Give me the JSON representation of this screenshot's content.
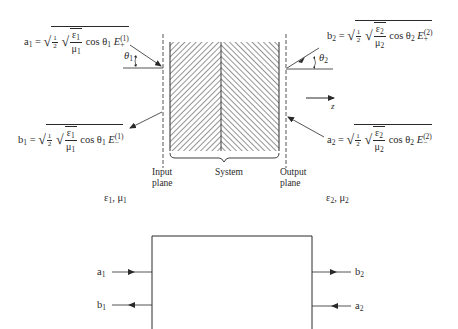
{
  "figure": {
    "top_diagram": {
      "formulas": {
        "a1": {
          "lhs": "a",
          "lhs_sub": "1",
          "num": "1",
          "den": "2",
          "eps": "ε",
          "eps_sub": "1",
          "mu": "μ",
          "mu_sub": "1",
          "cos": "cos θ",
          "cos_sub": "1",
          "field": "E",
          "field_sub": "+",
          "field_sup": "(1)"
        },
        "b1": {
          "lhs": "b",
          "lhs_sub": "1",
          "num": "1",
          "den": "2",
          "eps": "ε",
          "eps_sub": "1",
          "mu": "μ",
          "mu_sub": "1",
          "cos": "cos θ",
          "cos_sub": "1",
          "field": "E",
          "field_sub": "−",
          "field_sup": "(1)"
        },
        "b2": {
          "lhs": "b",
          "lhs_sub": "2",
          "num": "1",
          "den": "2",
          "eps": "ε",
          "eps_sub": "2",
          "mu": "μ",
          "mu_sub": "2",
          "cos": "cos θ",
          "cos_sub": "2",
          "field": "E",
          "field_sub": "+",
          "field_sup": "(2)"
        },
        "a2": {
          "lhs": "a",
          "lhs_sub": "2",
          "num": "1",
          "den": "2",
          "eps": "ε",
          "eps_sub": "2",
          "mu": "μ",
          "mu_sub": "2",
          "cos": "cos θ",
          "cos_sub": "2",
          "field": "E",
          "field_sub": "−",
          "field_sup": "(2)"
        }
      },
      "angles": {
        "theta1": {
          "sym": "θ",
          "sub": "1"
        },
        "theta2": {
          "sym": "θ",
          "sub": "2"
        }
      },
      "axis_label": "z",
      "labels": {
        "input_plane": [
          "Input",
          "plane"
        ],
        "system": "System",
        "output_plane": [
          "Output",
          "plane"
        ]
      },
      "media": {
        "left": {
          "eps": "ε",
          "eps_sub": "1",
          "sep": ", ",
          "mu": "μ",
          "mu_sub": "1"
        },
        "right": {
          "eps": "ε",
          "eps_sub": "2",
          "sep": ", ",
          "mu": "μ",
          "mu_sub": "2"
        }
      }
    },
    "bottom_diagram": {
      "ports": {
        "a1": {
          "sym": "a",
          "sub": "1",
          "direction": "in"
        },
        "b1": {
          "sym": "b",
          "sub": "1",
          "direction": "out"
        },
        "b2": {
          "sym": "b",
          "sub": "2",
          "direction": "out"
        },
        "a2": {
          "sym": "a",
          "sub": "2",
          "direction": "in"
        }
      }
    },
    "colors": {
      "ink": "#2a2a2a",
      "background": "#ffffff"
    }
  }
}
